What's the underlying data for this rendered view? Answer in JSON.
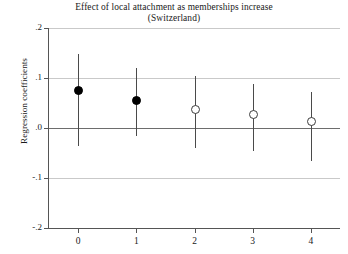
{
  "chart_data": {
    "type": "scatter",
    "title": "Effect of local attachment as memberships increase",
    "subtitle": "(Switzerland)",
    "xlabel": "",
    "ylabel": "Regression coefficients",
    "xlim": [
      -0.5,
      4.5
    ],
    "ylim": [
      -0.2,
      0.2
    ],
    "grid": true,
    "legend": "none",
    "x": [
      0,
      1,
      2,
      3,
      4
    ],
    "xticklabels": [
      "0",
      "1",
      "2",
      "3",
      "4"
    ],
    "yticks": [
      0.2,
      0.1,
      0.0,
      -0.1,
      -0.2
    ],
    "yticklabels": [
      ".2",
      ".1",
      ".0",
      "-.1",
      "-.2"
    ],
    "series": [
      {
        "name": "Regression coefficient",
        "values": [
          0.075,
          0.056,
          0.038,
          0.028,
          0.014
        ],
        "ci_low": [
          -0.036,
          -0.016,
          -0.04,
          -0.046,
          -0.066
        ],
        "ci_high": [
          0.149,
          0.121,
          0.105,
          0.089,
          0.072
        ],
        "marker_fill": [
          "filled",
          "filled",
          "hollow",
          "hollow",
          "hollow"
        ]
      }
    ],
    "colors": {
      "marker_filled": "#000000",
      "marker_hollow_edge": "#3c3c3c",
      "ci_line": "#4a4a4a",
      "gridline": "#c9c9c9",
      "zero_line": "#6d6d6d",
      "axis": "#555555",
      "background": "#ffffff"
    }
  }
}
